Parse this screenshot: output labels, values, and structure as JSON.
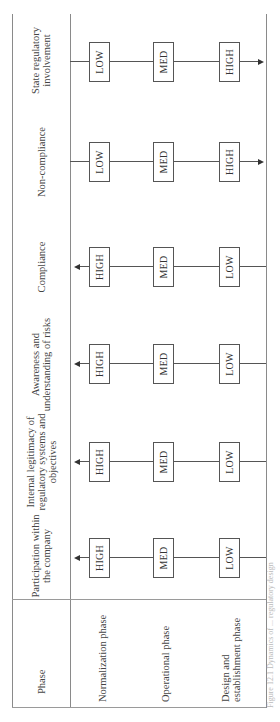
{
  "table": {
    "phase_header": "Phase",
    "phases": [
      "Normalization phase",
      "Operational phase",
      "Design and establishment phase"
    ],
    "columns": [
      {
        "header": "Participation within the company",
        "direction": "increasing",
        "values": [
          "HIGH",
          "MED",
          "LOW"
        ]
      },
      {
        "header": "Internal legitimacy of regulatory systems and objectives",
        "direction": "increasing",
        "values": [
          "HIGH",
          "MED",
          "LOW"
        ]
      },
      {
        "header": "Awareness and understanding of risks",
        "direction": "increasing",
        "values": [
          "HIGH",
          "MED",
          "LOW"
        ]
      },
      {
        "header": "Compliance",
        "direction": "increasing",
        "values": [
          "HIGH",
          "MED",
          "LOW"
        ]
      },
      {
        "header": "Non-compliance",
        "direction": "decreasing",
        "values": [
          "LOW",
          "MED",
          "HIGH"
        ]
      },
      {
        "header": "State regulatory involvement",
        "direction": "decreasing",
        "values": [
          "LOW",
          "MED",
          "HIGH"
        ]
      }
    ]
  },
  "caption": "Figure 12.1  Dynamics of ... regulatory design"
}
